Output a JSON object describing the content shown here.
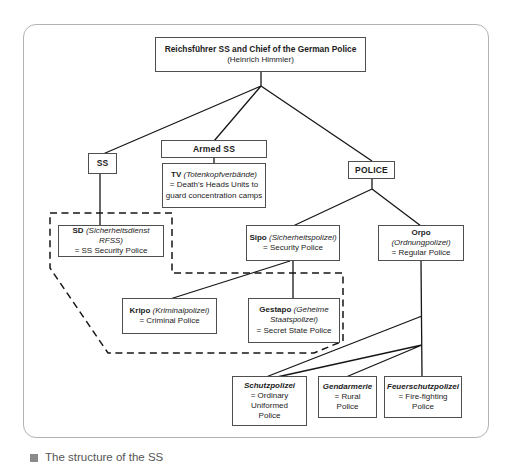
{
  "diagram": {
    "nodes": {
      "himmler": {
        "title": "Reichsführer SS and Chief of the German Police",
        "subtitle": "(Heinrich Himmler)"
      },
      "ss": {
        "title": "SS"
      },
      "armed_ss": {
        "title": "Armed SS"
      },
      "tv": {
        "bold": "TV",
        "italic": "(Totenkopfverbände)",
        "line2": "= Death's Heads Units to",
        "line3": "guard concentration camps"
      },
      "police": {
        "title": "POLICE"
      },
      "sd": {
        "bold": "SD",
        "italic": "(Sicherheitsdienst RFSS)",
        "line2": "= SS Security Police"
      },
      "sipo": {
        "bold": "Sipo",
        "italic": "(Sicherheitspolizei)",
        "line2": "= Security Police"
      },
      "orpo": {
        "bold": "Orpo",
        "italic": "(Ordnungpolizei)",
        "line2": "= Regular Police"
      },
      "kripo": {
        "bold": "Kripo",
        "italic": "(Kriminalpolizei)",
        "line2": "= Criminal Police"
      },
      "gestapo": {
        "bold": "Gestapo",
        "italic": "(Geheime Staatspolizei)",
        "line2": "= Secret State Police"
      },
      "schutzpolizei": {
        "name": "Schutzpolizei",
        "line2": "= Ordinary",
        "line3": "Uniformed",
        "line4": "Police"
      },
      "gendarmerie": {
        "name": "Gendarmerie",
        "line2": "= Rural",
        "line3": "Police"
      },
      "feuerschutzpolizei": {
        "name": "Feuerschutzpolizei",
        "line2": "= Fire-fighting",
        "line3": "Police"
      }
    },
    "caption": {
      "text": "The structure of the SS"
    },
    "colors": {
      "line": "#161616",
      "dashed_line": "#161616",
      "box_border": "#4f4f4f",
      "outer_border": "#b3b3b3",
      "text": "#1c1c1c",
      "caption_text": "#555555"
    }
  }
}
